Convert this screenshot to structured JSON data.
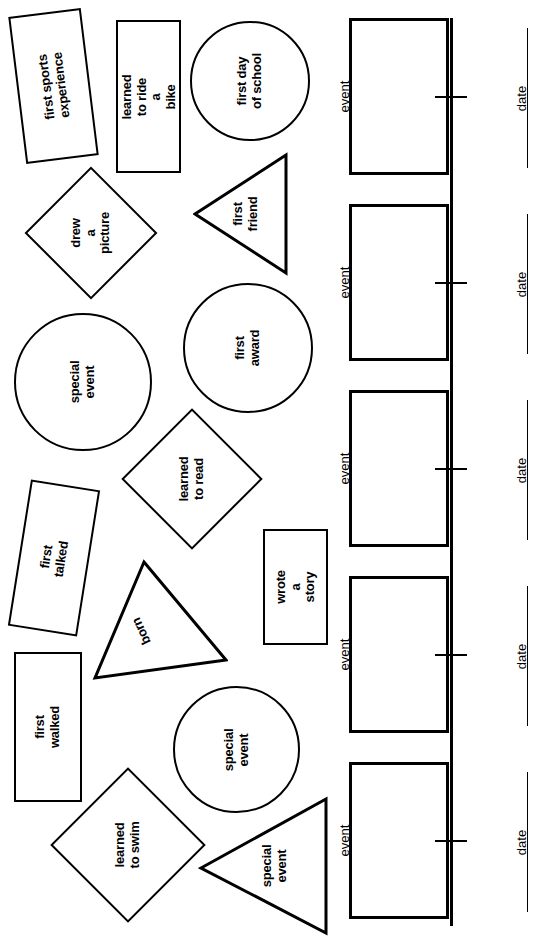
{
  "page": {
    "orientation": "rotated-90",
    "background_color": "#ffffff",
    "ink_color": "#000000",
    "width": 556,
    "height": 944
  },
  "timeline": {
    "axis_label": "timeline-axis",
    "slots": [
      {
        "event_label": "event",
        "date_label": "date"
      },
      {
        "event_label": "event",
        "date_label": "date"
      },
      {
        "event_label": "event",
        "date_label": "date"
      },
      {
        "event_label": "event",
        "date_label": "date"
      },
      {
        "event_label": "event",
        "date_label": "date"
      }
    ]
  },
  "cutouts": [
    {
      "id": "first-sports-experience",
      "shape": "rectangle",
      "text": "first sports\nexperience"
    },
    {
      "id": "learned-to-ride-a-bike",
      "shape": "rectangle",
      "text": "learned to ride a\nbike"
    },
    {
      "id": "first-day-of-school",
      "shape": "circle",
      "text": "first day\nof school"
    },
    {
      "id": "drew-a-picture",
      "shape": "diamond",
      "text": "drew\na picture"
    },
    {
      "id": "first-friend",
      "shape": "triangle",
      "text": "first\nfriend"
    },
    {
      "id": "special-event-top",
      "shape": "circle",
      "text": "special event"
    },
    {
      "id": "first-award",
      "shape": "circle",
      "text": "first award"
    },
    {
      "id": "learned-to-read",
      "shape": "diamond",
      "text": "learned\nto read"
    },
    {
      "id": "first-talked",
      "shape": "rectangle",
      "text": "first talked"
    },
    {
      "id": "wrote-a-story",
      "shape": "rectangle",
      "text": "wrote a story"
    },
    {
      "id": "born",
      "shape": "triangle",
      "text": "born"
    },
    {
      "id": "first-walked",
      "shape": "rectangle",
      "text": "first walked"
    },
    {
      "id": "special-event-bottom",
      "shape": "circle",
      "text": "special event"
    },
    {
      "id": "learned-to-swim",
      "shape": "diamond",
      "text": "learned to swim"
    },
    {
      "id": "special-event-triangle",
      "shape": "triangle",
      "text": "special\nevent"
    }
  ]
}
